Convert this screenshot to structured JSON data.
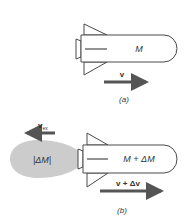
{
  "diagram": {
    "colors": {
      "stroke": "#4a4a4a",
      "arrow": "#555555",
      "plume": "#cccccc",
      "text": "#333333"
    },
    "panel_a": {
      "caption": "(a)",
      "mass_label": "M",
      "velocity_label": "v"
    },
    "panel_b": {
      "caption": "(b)",
      "mass_label": "M + ΔM",
      "exhaust_mass_label": "|ΔM|",
      "exhaust_velocity_label": "v",
      "exhaust_velocity_subscript": "ex",
      "velocity_label": "v + Δv"
    }
  }
}
